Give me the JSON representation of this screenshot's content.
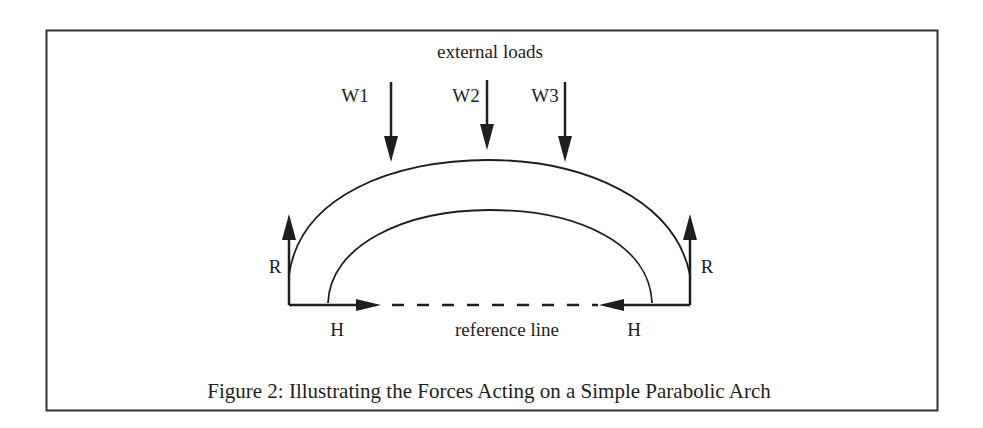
{
  "figure": {
    "caption": "Figure 2: Illustrating the Forces Acting on a Simple Parabolic Arch",
    "border_color": "#333333",
    "ink_color": "#1e1e1e"
  },
  "labels": {
    "external_loads": "external loads",
    "loads": [
      "W1",
      "W2",
      "W3"
    ],
    "reaction_left": "R",
    "reaction_right": "R",
    "thrust_left": "H",
    "thrust_right": "H",
    "reference_line": "reference line"
  }
}
